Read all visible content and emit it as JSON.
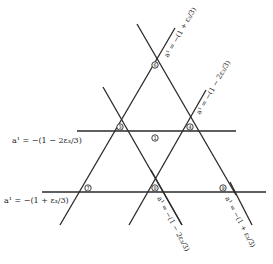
{
  "diagram": {
    "regions": [
      {
        "id": "top",
        "label": "6"
      },
      {
        "id": "mid-left",
        "label": "3"
      },
      {
        "id": "mid-right",
        "label": "4"
      },
      {
        "id": "center",
        "label": "1"
      },
      {
        "id": "bottom-left",
        "label": "7"
      },
      {
        "id": "bottom-center",
        "label": "8"
      },
      {
        "id": "bottom-right",
        "label": "9"
      }
    ],
    "line_labels": {
      "top_right": "a¹ = −(1 + ε₃/3)",
      "mid_right": "a¹ = −(1 − 2ε₃/3)",
      "mid_left_horizontal": "a¹ = −(1 − 2ε₃/3)",
      "bottom_left_horizontal": "a¹ = −(1 + ε₃/3)",
      "bottom_center_diag": "a¹ = −(1 − 2ε₃/3)",
      "bottom_right_diag": "a¹ = −(1 + ε₃/3)"
    }
  }
}
